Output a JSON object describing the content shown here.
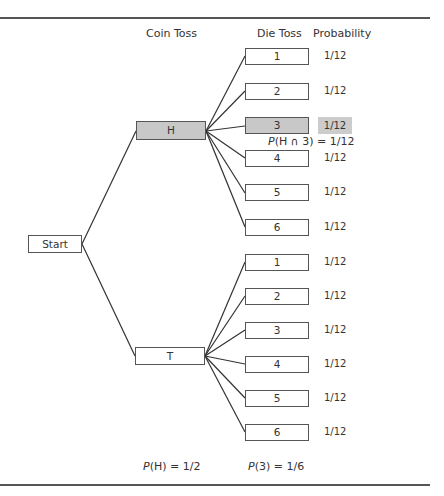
{
  "headers": {
    "coin_toss": "Coin Toss",
    "die_toss": "Die Toss",
    "probability": "Probability"
  },
  "start": {
    "label": "Start"
  },
  "coin": [
    {
      "label": "H",
      "highlighted": true
    },
    {
      "label": "T",
      "highlighted": false
    }
  ],
  "die_h": [
    {
      "label": "1",
      "prob": "1/12"
    },
    {
      "label": "2",
      "prob": "1/12"
    },
    {
      "label": "3",
      "prob": "1/12",
      "highlighted": true
    },
    {
      "label": "4",
      "prob": "1/12"
    },
    {
      "label": "5",
      "prob": "1/12"
    },
    {
      "label": "6",
      "prob": "1/12"
    }
  ],
  "die_t": [
    {
      "label": "1",
      "prob": "1/12"
    },
    {
      "label": "2",
      "prob": "1/12"
    },
    {
      "label": "3",
      "prob": "1/12"
    },
    {
      "label": "4",
      "prob": "1/12"
    },
    {
      "label": "5",
      "prob": "1/12"
    },
    {
      "label": "6",
      "prob": "1/12"
    }
  ],
  "annotations": {
    "intersection": {
      "p": "P",
      "expr": "(H ∩ 3) = 1/12"
    },
    "p_heads": {
      "p": "P",
      "expr": "(H) = 1/2"
    },
    "p_three": {
      "p": "P",
      "expr": "(3) = 1/6"
    }
  },
  "colors": {
    "shade": "#c8c8c8",
    "line": "#333333",
    "rule": "#555555"
  }
}
